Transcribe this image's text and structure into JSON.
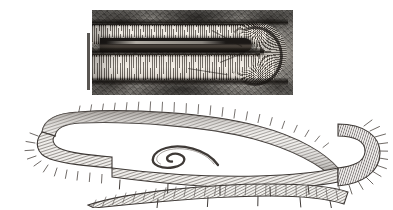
{
  "figure": {
    "background_color": "#ffffff",
    "width": 393,
    "height": 210,
    "panel_count": 2
  },
  "panels": {
    "micrograph": {
      "name": "light micrograph",
      "description": "Grayscale light micrograph of a U-shaped annelid worm within its tube, showing dense transverse annulations, a dark internal gut band and a fan of setae at the right-hand bend.",
      "media": "grayscale photomicrograph",
      "frame": {
        "x": 92,
        "y": 10,
        "width": 201,
        "height": 85
      },
      "tone_dark": "#171411",
      "tone_mid": "#8e8a84",
      "tone_light": "#ece7de"
    },
    "scale_bar": {
      "name": "scale bar",
      "orientation": "vertical",
      "label": "",
      "color": "#595652",
      "position": {
        "x": 87,
        "y": 33,
        "width": 3,
        "height": 57
      }
    },
    "drawing": {
      "name": "line drawing",
      "description": "Pen-and-ink line drawing of the same elongate annelid, doubled back on itself: a long anterior trunk curving from a left U-bend across to a broad right U-bend, a slender coiled posterior tip in the centre, and a densely setigerous posterior band below.",
      "medium": "ink stipple and hatching",
      "ink_color": "#4a4440",
      "frame": {
        "x": 8,
        "y": 96,
        "width": 380,
        "height": 112
      },
      "features": [
        {
          "label": "left U-bend",
          "note": "narrow anterior fold"
        },
        {
          "label": "coiled posterior tip",
          "note": "slender spiral in mid-field"
        },
        {
          "label": "right U-bend",
          "note": "broad turn bearing radiating setal fan"
        },
        {
          "label": "setigerous band",
          "note": "lower limb with dense oblique chaetae"
        }
      ]
    }
  }
}
